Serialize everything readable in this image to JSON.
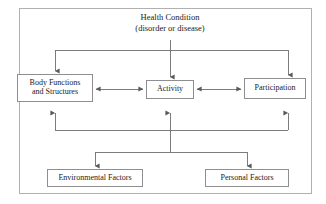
{
  "diagram": {
    "frame": {
      "border_color": "#b0b0b0",
      "background": "#ffffff"
    },
    "style": {
      "box_border_color": "#8e8e8e",
      "line_color": "#6e6e6e",
      "text_color": "#1b1b1b"
    },
    "nodes": {
      "health_condition": {
        "label": "Health Condition\n(disorder or disease)",
        "boxed": "false"
      },
      "body_functions": {
        "label": "Body Functions\nand Structures",
        "boxed": "true"
      },
      "activity": {
        "label": "Activity",
        "boxed": "true"
      },
      "participation": {
        "label": "Participation",
        "boxed": "true"
      },
      "environmental_factors": {
        "label": "Environmental Factors",
        "boxed": "true"
      },
      "personal_factors": {
        "label": "Personal Factors",
        "boxed": "true"
      }
    },
    "connections": [
      {
        "from": "health_condition",
        "to": "body_functions",
        "arrow": "down"
      },
      {
        "from": "health_condition",
        "to": "activity",
        "arrow": "down"
      },
      {
        "from": "health_condition",
        "to": "participation",
        "arrow": "down"
      },
      {
        "from": "body_functions",
        "to": "activity",
        "arrow": "bidirectional"
      },
      {
        "from": "activity",
        "to": "participation",
        "arrow": "bidirectional"
      },
      {
        "from": "environmental_factors",
        "to": "body_functions",
        "arrow": "up"
      },
      {
        "from": "environmental_factors",
        "to": "activity",
        "arrow": "up"
      },
      {
        "from": "environmental_factors",
        "to": "participation",
        "arrow": "up"
      },
      {
        "from": "personal_factors",
        "to": "body_functions",
        "arrow": "up"
      },
      {
        "from": "personal_factors",
        "to": "activity",
        "arrow": "up"
      },
      {
        "from": "personal_factors",
        "to": "participation",
        "arrow": "up"
      }
    ]
  }
}
